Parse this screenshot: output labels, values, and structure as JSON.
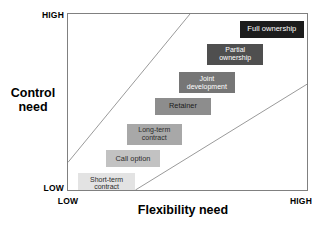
{
  "chart_data": {
    "type": "scatter",
    "title": "",
    "xlabel": "Flexibility need",
    "ylabel": "Control need",
    "x_ticks": [
      "LOW",
      "HIGH"
    ],
    "y_ticks": [
      "LOW",
      "HIGH"
    ],
    "xlim": [
      0,
      100
    ],
    "ylim": [
      0,
      100
    ],
    "grid": false,
    "legend": "none",
    "annotations": [
      "Two diagonal boundary lines divide the plot into bands; option boxes are arranged along the rising diagonal from low control/low flexibility to high control/high flexibility."
    ],
    "series": [
      {
        "name": "Governance options",
        "points": [
          {
            "label": "Short-term\ncontract",
            "x": 6,
            "y": 5,
            "fill": "#e3e3e3",
            "text_color": "#2b2b2b"
          },
          {
            "label": "Call option",
            "x": 20,
            "y": 20,
            "fill": "#c2c2c2",
            "text_color": "#2b2b2b"
          },
          {
            "label": "Long-term\ncontract",
            "x": 32,
            "y": 35,
            "fill": "#a8a8a8",
            "text_color": "#2b2b2b"
          },
          {
            "label": "Retainer",
            "x": 44,
            "y": 50,
            "fill": "#8d8d8d",
            "text_color": "#1a1a1a"
          },
          {
            "label": "Joint\ndevelopment",
            "x": 56,
            "y": 64,
            "fill": "#767676",
            "text_color": "#ffffff"
          },
          {
            "label": "Partial\nownership",
            "x": 70,
            "y": 80,
            "fill": "#4f4f4f",
            "text_color": "#ffffff"
          },
          {
            "label": "Full ownership",
            "x": 84,
            "y": 94,
            "fill": "#1c1c1c",
            "text_color": "#ffffff"
          }
        ]
      }
    ],
    "boundary_lines": [
      {
        "name": "upper-diagonal",
        "x1": 0,
        "y1": 16,
        "x2": 51,
        "y2": 100,
        "color": "#9a9a9a"
      },
      {
        "name": "lower-diagonal",
        "x1": 28,
        "y1": 0,
        "x2": 100,
        "y2": 60,
        "color": "#9a9a9a"
      }
    ]
  },
  "figure": {
    "background_color": "#ffffff",
    "frame_color": "#808080"
  },
  "axes": {
    "y": {
      "title": "Control\nneed",
      "high_label": "HIGH",
      "low_label": "LOW"
    },
    "x": {
      "title": "Flexibility need",
      "high_label": "HIGH",
      "low_label": "LOW"
    }
  },
  "boxes": [
    {
      "id": "full-ownership",
      "label": "Full ownership",
      "left_pct": 71.8,
      "top_pct": 3.9,
      "width_pct": 27.0,
      "height_pct": 9.6,
      "fill": "#1c1c1c",
      "text_color": "#ffffff",
      "font_size_px": 7.6
    },
    {
      "id": "partial-ownership",
      "label": "Partial\nownership",
      "left_pct": 58.1,
      "top_pct": 16.9,
      "width_pct": 23.7,
      "height_pct": 11.8,
      "fill": "#4f4f4f",
      "text_color": "#ffffff",
      "font_size_px": 7.0
    },
    {
      "id": "joint-development",
      "label": "Joint\ndevelopment",
      "left_pct": 46.5,
      "top_pct": 33.1,
      "width_pct": 23.2,
      "height_pct": 11.8,
      "fill": "#767676",
      "text_color": "#ffffff",
      "font_size_px": 7.0
    },
    {
      "id": "retainer",
      "label": "Retainer",
      "left_pct": 36.5,
      "top_pct": 47.8,
      "width_pct": 23.2,
      "height_pct": 9.6,
      "fill": "#8d8d8d",
      "text_color": "#1a1a1a",
      "font_size_px": 7.4
    },
    {
      "id": "long-term-contract",
      "label": "Long-term\ncontract",
      "left_pct": 24.5,
      "top_pct": 62.4,
      "width_pct": 23.2,
      "height_pct": 11.8,
      "fill": "#a8a8a8",
      "text_color": "#2b2b2b",
      "font_size_px": 7.0
    },
    {
      "id": "call-option",
      "label": "Call option",
      "left_pct": 15.8,
      "top_pct": 77.5,
      "width_pct": 22.8,
      "height_pct": 9.6,
      "fill": "#c2c2c2",
      "text_color": "#2b2b2b",
      "font_size_px": 7.4
    },
    {
      "id": "short-term-contract",
      "label": "Short-term\ncontract",
      "left_pct": 4.1,
      "top_pct": 90.4,
      "width_pct": 24.1,
      "height_pct": 11.8,
      "fill": "#e3e3e3",
      "text_color": "#2b2b2b",
      "font_size_px": 7.0
    }
  ]
}
